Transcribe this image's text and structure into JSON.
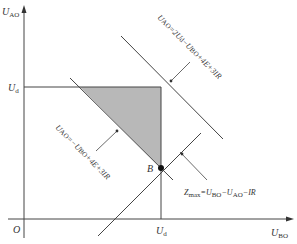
{
  "diagram": {
    "type": "linear-programming feasible region",
    "axes": {
      "y_label": "U",
      "y_label_sub": "AO",
      "x_label": "U",
      "x_label_sub": "BO",
      "origin_label": "O"
    },
    "ticks": {
      "y_tick_label": "U",
      "y_tick_sub": "d",
      "x_tick_label": "U",
      "x_tick_sub": "d"
    },
    "point_label": "B",
    "constraints": [
      {
        "id": "upper-line",
        "label_parts": [
          "U",
          "AO",
          "=2U",
          "d",
          "−U",
          "BO",
          "+4E+3IR"
        ]
      },
      {
        "id": "lower-line",
        "label_parts": [
          "U",
          "AO",
          "=−U",
          "BO",
          "+4E+3IR"
        ]
      }
    ],
    "objective": {
      "label_parts": [
        "Z",
        "max",
        "=U",
        "BO",
        "−U",
        "AO",
        "−IR"
      ]
    },
    "colors": {
      "line": "#444444",
      "shade": "#b8b8b8",
      "text": "#333333"
    }
  }
}
